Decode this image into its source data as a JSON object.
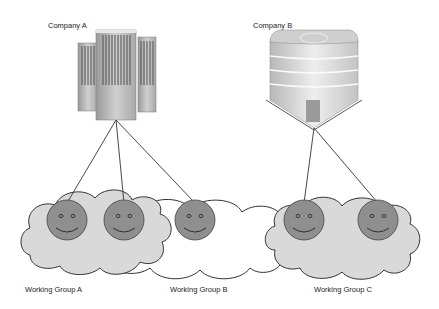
{
  "companies": [
    {
      "id": "a",
      "label": "Company A",
      "icon": "office-towers-icon"
    },
    {
      "id": "b",
      "label": "Company B",
      "icon": "round-building-icon"
    }
  ],
  "groups": [
    {
      "id": "a",
      "label": "Working Group A",
      "members": 2
    },
    {
      "id": "b",
      "label": "Working Group B",
      "members": 1
    },
    {
      "id": "c",
      "label": "Working Group C",
      "members": 2
    }
  ],
  "connections": [
    {
      "from": "Company A",
      "to": "Working Group A member 1"
    },
    {
      "from": "Company A",
      "to": "Working Group A member 2"
    },
    {
      "from": "Company A",
      "to": "Working Group B member 1"
    },
    {
      "from": "Company B",
      "to": "Working Group C member 1"
    },
    {
      "from": "Company B",
      "to": "Working Group C member 2"
    }
  ],
  "colors": {
    "cloud_fill": "#d9d9d9",
    "cloud_stroke": "#333333",
    "face_fill": "#8f8f8f",
    "line": "#333333"
  }
}
